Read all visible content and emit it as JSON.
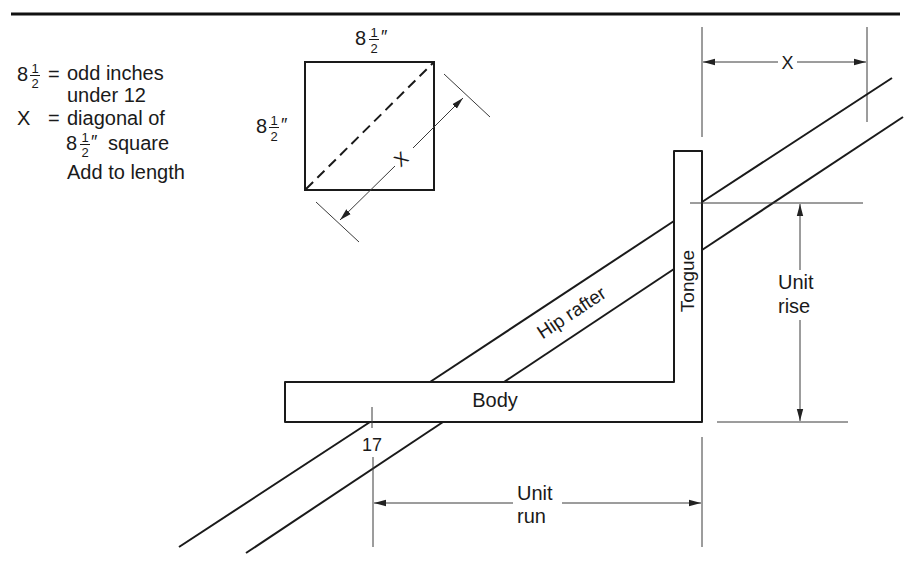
{
  "legend": {
    "line1": {
      "whole": "8",
      "num": "1",
      "den": "2",
      "eq": "=",
      "text": "odd inches"
    },
    "line2": "under 12",
    "line3": {
      "symbol": "X",
      "eq": "=",
      "text": "diagonal of"
    },
    "line4": {
      "whole": "8",
      "num": "1",
      "den": "2",
      "unit": "″",
      "text": "square"
    },
    "line5": "Add to length"
  },
  "square_diagram": {
    "top_label": {
      "whole": "8",
      "num": "1",
      "den": "2",
      "unit": "″"
    },
    "side_label": {
      "whole": "8",
      "num": "1",
      "den": "2",
      "unit": "″"
    },
    "diagonal_label": "X"
  },
  "main_diagram": {
    "x_dimension_label": "X",
    "tongue_label": "Tongue",
    "body_label": "Body",
    "rafter_label": "Hip rafter",
    "mark_label": "17",
    "unit_rise_label": {
      "line1": "Unit",
      "line2": "rise"
    },
    "unit_run_label": {
      "line1": "Unit",
      "line2": "run"
    }
  }
}
